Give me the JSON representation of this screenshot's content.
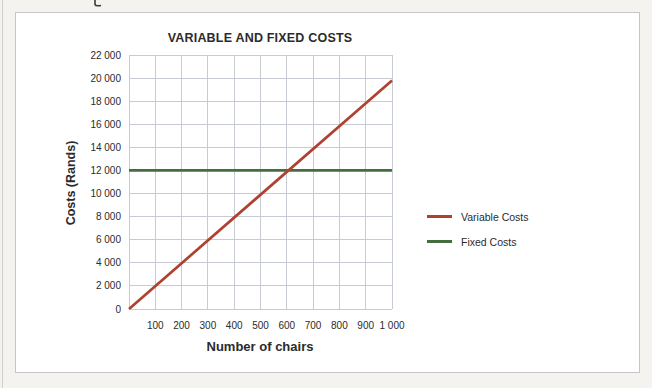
{
  "page": {
    "background": "#F5F3F0",
    "card_background": "#FFFFFF",
    "card_border": "#C6C6C6",
    "edge_line_color": "#D2D0CC",
    "text_color": "#2B2B2B"
  },
  "chart_data": {
    "type": "line",
    "title": "VARIABLE AND FIXED COSTS",
    "xlabel": "Number of chairs",
    "ylabel": "Costs (Rands)",
    "xlim": [
      0,
      1000
    ],
    "ylim": [
      0,
      22000
    ],
    "grid": true,
    "grid_color": "#C7CBD4",
    "legend_position": "right",
    "x_ticks": [
      100,
      200,
      300,
      400,
      500,
      600,
      700,
      800,
      900,
      1000
    ],
    "x_tick_labels": [
      "100",
      "200",
      "300",
      "400",
      "500",
      "600",
      "700",
      "800",
      "900",
      "1 000"
    ],
    "y_ticks": [
      0,
      2000,
      4000,
      6000,
      8000,
      10000,
      12000,
      14000,
      16000,
      18000,
      20000,
      22000
    ],
    "y_tick_labels": [
      "0",
      "2 000",
      "4 000",
      "6 000",
      "8 000",
      "10 000",
      "12 000",
      "14 000",
      "16 000",
      "18 000",
      "20 000",
      "22 000"
    ],
    "series": [
      {
        "name": "Variable Costs",
        "color": "#AF4130",
        "x": [
          0,
          1000
        ],
        "values": [
          0,
          19800
        ]
      },
      {
        "name": "Fixed Costs",
        "color": "#446E3E",
        "x": [
          0,
          1000
        ],
        "values": [
          12000,
          12000
        ]
      }
    ]
  }
}
